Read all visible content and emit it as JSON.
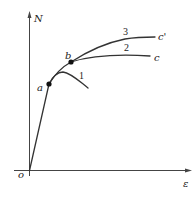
{
  "diagram": {
    "axes": {
      "y_label": "N",
      "x_label": "ε",
      "origin_label": "o"
    },
    "points": {
      "a": "a",
      "b": "b",
      "c": "c",
      "c_prime": "c'"
    },
    "curves": [
      {
        "id": "1",
        "label": "1"
      },
      {
        "id": "2",
        "label": "2"
      },
      {
        "id": "3",
        "label": "3"
      }
    ],
    "colors": {
      "line": "#333333",
      "background": "#ffffff"
    }
  }
}
